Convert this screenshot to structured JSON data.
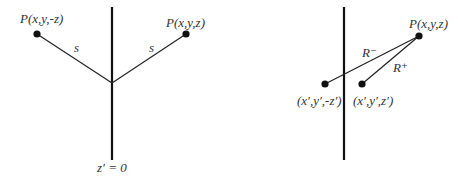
{
  "colors": {
    "ink": "#111111",
    "text": "#333333",
    "background": "#ffffff"
  },
  "left_panel": {
    "point_left_label": "P(x,y,-z)",
    "point_right_label": "P(x,y,z)",
    "segment_left_label": "s",
    "segment_right_label": "s",
    "plane_label": "z′ = 0"
  },
  "right_panel": {
    "point_label": "P(x,y,z)",
    "distance_minus_label": "R⁻",
    "distance_plus_label": "R⁺",
    "image_point_left_label": "(x′,y′,-z′)",
    "image_point_right_label": "(x′,y′,z′)"
  }
}
